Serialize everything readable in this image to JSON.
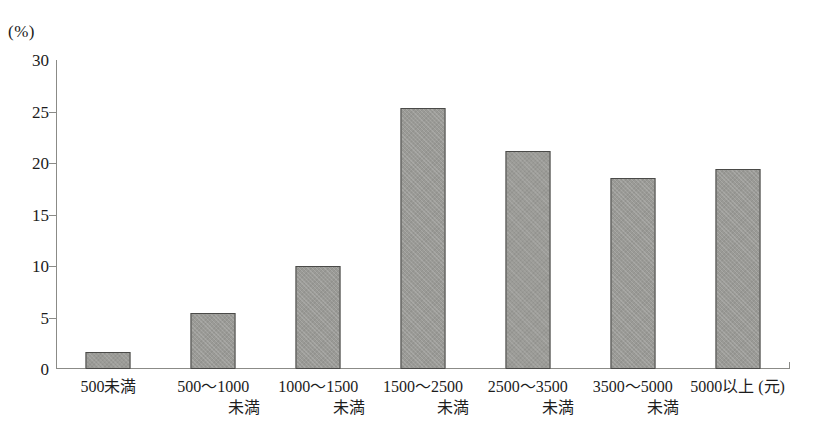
{
  "chart_data": {
    "type": "bar",
    "title": "",
    "xlabel": "",
    "ylabel": "(%)",
    "unit_label": "(%)",
    "x_unit": "(元)",
    "ylim": [
      0,
      30
    ],
    "yticks": [
      0,
      5,
      10,
      15,
      20,
      25,
      30
    ],
    "ytick_labels": [
      "0",
      "5",
      "10",
      "15",
      "20",
      "25",
      "30"
    ],
    "grid": false,
    "legend": null,
    "categories": [
      "500未満",
      "500〜1000未満",
      "1000〜1500未満",
      "1500〜2500未満",
      "2500〜3500未満",
      "3500〜5000未満",
      "5000以上"
    ],
    "category_lines": [
      {
        "line1": "500未満",
        "line2": ""
      },
      {
        "line1": "500〜1000",
        "line2": "未満"
      },
      {
        "line1": "1000〜1500",
        "line2": "未満"
      },
      {
        "line1": "1500〜2500",
        "line2": "未満"
      },
      {
        "line1": "2500〜3500",
        "line2": "未満"
      },
      {
        "line1": "3500〜5000",
        "line2": "未満"
      },
      {
        "line1": "5000以上 (元)",
        "line2": ""
      }
    ],
    "values": [
      1.7,
      5.4,
      10.0,
      25.3,
      21.2,
      18.5,
      19.4
    ],
    "bar_color": "#9a9a96",
    "bar_border_color": "#4a4a48",
    "axis_color": "#8b8b87",
    "background_color": "#ffffff"
  }
}
